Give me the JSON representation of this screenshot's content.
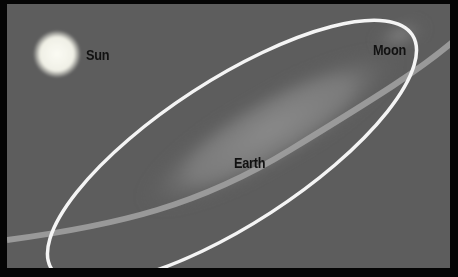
{
  "diagram": {
    "title": "",
    "labels": {
      "sun": "Sun",
      "moon": "Moon",
      "earth": "Earth"
    },
    "colors": {
      "background": "#5d5d5d",
      "border": "#050505",
      "orbit": "#f2f2f2",
      "text": "#111111"
    }
  }
}
